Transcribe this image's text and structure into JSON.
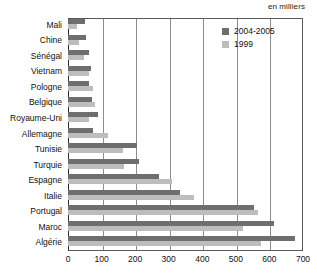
{
  "unit_caption": "en milliers",
  "legend": {
    "position": "top-right",
    "entries": [
      {
        "label": "2004-2005",
        "color": "#6e6e6e",
        "swatch_name": "legend-swatch-2004-2005"
      },
      {
        "label": "1999",
        "color": "#bdbdbd",
        "swatch_name": "legend-swatch-1999"
      }
    ]
  },
  "axis": {
    "ticks": [
      "0",
      "100",
      "200",
      "300",
      "400",
      "500",
      "600",
      "700"
    ]
  },
  "chart_data": {
    "type": "bar",
    "orientation": "horizontal",
    "title": "",
    "subtitle": "",
    "xlabel": "en milliers",
    "ylabel": "",
    "xlim": [
      0,
      700
    ],
    "xticks": [
      0,
      100,
      200,
      300,
      400,
      500,
      600,
      700
    ],
    "grid": true,
    "legend_position": "top-right",
    "categories": [
      "Mali",
      "Chine",
      "Sénégal",
      "Vietnam",
      "Pologne",
      "Belgique",
      "Royaume-Uni",
      "Allemagne",
      "Tunisie",
      "Turquie",
      "Espagne",
      "Italie",
      "Portugal",
      "Maroc",
      "Algérie"
    ],
    "series": [
      {
        "name": "2004-2005",
        "color": "#6e6e6e",
        "values": [
          52,
          55,
          62,
          68,
          62,
          70,
          90,
          75,
          205,
          212,
          270,
          335,
          555,
          615,
          675
        ]
      },
      {
        "name": "1999",
        "color": "#bdbdbd",
        "values": [
          26,
          32,
          48,
          62,
          75,
          80,
          62,
          118,
          165,
          168,
          310,
          375,
          565,
          520,
          575
        ]
      }
    ]
  }
}
